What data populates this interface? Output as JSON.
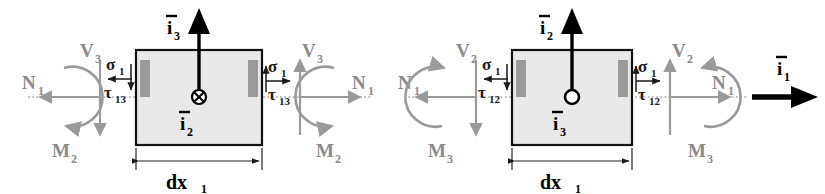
{
  "figure": {
    "background_color": "#ffffff",
    "gray_label_color": "#8a8a8a",
    "black_label_color": "#000000",
    "box_fill_color": "#e8e8e8",
    "stress_bar_color": "#9a9a9a"
  },
  "panels": [
    {
      "id": "left-panel",
      "name": "x1-x3-plane-element",
      "center_marker": "cross-in-circle",
      "center_marker_meaning": "into-page",
      "basis_vectors": {
        "vertical": {
          "symbol": "i",
          "subscript": "3",
          "direction": "up"
        },
        "center": {
          "symbol": "i",
          "subscript": "2",
          "direction": "into-page"
        }
      },
      "left_face": {
        "axial": {
          "symbol": "N",
          "subscript": "1",
          "direction": "left"
        },
        "shear": {
          "symbol": "V",
          "subscript": "3",
          "direction": "down"
        },
        "moment": {
          "symbol": "M",
          "subscript": "2",
          "direction": "clockwise"
        }
      },
      "right_face": {
        "axial": {
          "symbol": "N",
          "subscript": "1",
          "direction": "right"
        },
        "shear": {
          "symbol": "V",
          "subscript": "3",
          "direction": "up"
        },
        "moment": {
          "symbol": "M",
          "subscript": "2",
          "direction": "counterclockwise"
        }
      },
      "left_stresses": {
        "normal": {
          "symbol": "σ",
          "subscript": "1",
          "direction": "left"
        },
        "shear": {
          "symbol": "τ",
          "subscript": "13",
          "direction": "down"
        }
      },
      "right_stresses": {
        "normal": {
          "symbol": "σ",
          "subscript": "1",
          "direction": "right"
        },
        "shear": {
          "symbol": "τ",
          "subscript": "13",
          "direction": "up"
        }
      },
      "dimension": {
        "symbol": "dx",
        "subscript": "1"
      }
    },
    {
      "id": "right-panel",
      "name": "x1-x2-plane-element",
      "center_marker": "dot-in-circle",
      "center_marker_meaning": "out-of-page",
      "basis_vectors": {
        "vertical": {
          "symbol": "i",
          "subscript": "2",
          "direction": "up"
        },
        "center": {
          "symbol": "i",
          "subscript": "3",
          "direction": "out-of-page"
        },
        "axial": {
          "symbol": "i",
          "subscript": "1",
          "direction": "right"
        }
      },
      "left_face": {
        "axial": {
          "symbol": "N",
          "subscript": "1",
          "direction": "left"
        },
        "shear": {
          "symbol": "V",
          "subscript": "2",
          "direction": "down"
        },
        "moment": {
          "symbol": "M",
          "subscript": "3",
          "direction": "counterclockwise"
        }
      },
      "right_face": {
        "axial": {
          "symbol": "N",
          "subscript": "1",
          "direction": "right"
        },
        "shear": {
          "symbol": "V",
          "subscript": "2",
          "direction": "up"
        },
        "moment": {
          "symbol": "M",
          "subscript": "3",
          "direction": "clockwise"
        }
      },
      "left_stresses": {
        "normal": {
          "symbol": "σ",
          "subscript": "1",
          "direction": "left"
        },
        "shear": {
          "symbol": "τ",
          "subscript": "12",
          "direction": "down"
        }
      },
      "right_stresses": {
        "normal": {
          "symbol": "σ",
          "subscript": "1",
          "direction": "right"
        },
        "shear": {
          "symbol": "τ",
          "subscript": "12",
          "direction": "up"
        }
      },
      "dimension": {
        "symbol": "dx",
        "subscript": "1"
      }
    }
  ],
  "labels": {
    "L_N_left": "N",
    "L_N_left_sub": "1",
    "L_V_left": "V",
    "L_V_left_sub": "3",
    "L_M_left": "M",
    "L_M_left_sub": "2",
    "L_N_right": "N",
    "L_N_right_sub": "1",
    "L_V_right": "V",
    "L_V_right_sub": "3",
    "L_M_right": "M",
    "L_M_right_sub": "2",
    "L_sigma_left": "σ",
    "L_sigma_left_sub": "1",
    "L_tau_left": "τ",
    "L_tau_left_sub": "13",
    "L_sigma_right": "σ",
    "L_sigma_right_sub": "1",
    "L_tau_right": "τ",
    "L_tau_right_sub": "13",
    "L_i_up": "i",
    "L_i_up_sub": "3",
    "L_i_center": "i",
    "L_i_center_sub": "2",
    "L_dx": "dx",
    "L_dx_sub": "1",
    "R_N_left": "N",
    "R_N_left_sub": "1",
    "R_V_left": "V",
    "R_V_left_sub": "2",
    "R_M_left": "M",
    "R_M_left_sub": "3",
    "R_N_right": "N",
    "R_N_right_sub": "1",
    "R_V_right": "V",
    "R_V_right_sub": "2",
    "R_M_right": "M",
    "R_M_right_sub": "3",
    "R_sigma_left": "σ",
    "R_sigma_left_sub": "1",
    "R_tau_left": "τ",
    "R_tau_left_sub": "12",
    "R_sigma_right": "σ",
    "R_sigma_right_sub": "1",
    "R_tau_right": "τ",
    "R_tau_right_sub": "12",
    "R_i_up": "i",
    "R_i_up_sub": "2",
    "R_i_center": "i",
    "R_i_center_sub": "3",
    "R_i_axial": "i",
    "R_i_axial_sub": "1",
    "R_dx": "dx",
    "R_dx_sub": "1"
  }
}
